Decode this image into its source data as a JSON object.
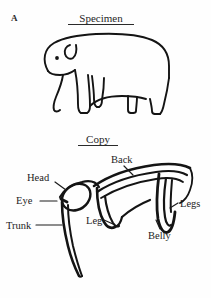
{
  "figure": {
    "panel_letter": "A",
    "background_color": "#fefefe",
    "ink_color": "#1a1a1a"
  },
  "sections": {
    "specimen": {
      "title": "Specimen",
      "underlined": true,
      "drawing": "elephant-intact-outline"
    },
    "copy": {
      "title": "Copy",
      "underlined": true,
      "drawing": "elephant-fragmented-outline"
    }
  },
  "annotations": {
    "items": [
      {
        "id": "head",
        "label": "Head",
        "leader": true
      },
      {
        "id": "eye",
        "label": "Eye",
        "leader": true
      },
      {
        "id": "trunk",
        "label": "Trunk",
        "leader": true
      },
      {
        "id": "back",
        "label": "Back",
        "leader": true
      },
      {
        "id": "leg",
        "label": "Leg",
        "leader": true
      },
      {
        "id": "legs",
        "label": "Legs",
        "leader": true
      },
      {
        "id": "belly",
        "label": "Belly",
        "leader": true
      }
    ]
  }
}
